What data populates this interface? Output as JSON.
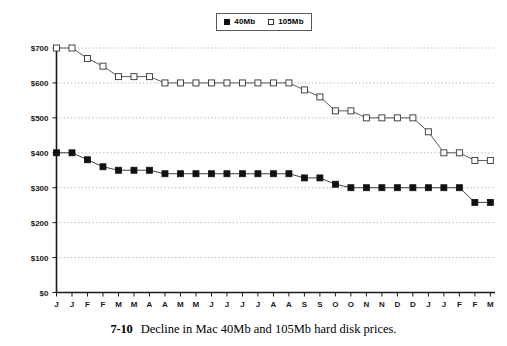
{
  "figure": {
    "caption_number": "7-10",
    "caption_text": "Decline in Mac 40Mb and 105Mb hard disk prices."
  },
  "legend": {
    "position": "top-center",
    "entries": [
      {
        "label": "40Mb",
        "marker": "filled-square",
        "color": "#111111"
      },
      {
        "label": "105Mb",
        "marker": "open-square",
        "color": "#333333"
      }
    ]
  },
  "chart_data": {
    "type": "line",
    "title": "",
    "subtitle": "",
    "xlabel": "",
    "ylabel": "",
    "ylim": [
      0,
      700
    ],
    "yticks": [
      0,
      100,
      200,
      300,
      400,
      500,
      600,
      700
    ],
    "ytick_labels": [
      "$0",
      "$100",
      "$200",
      "$300",
      "$400",
      "$500",
      "$600",
      "$700"
    ],
    "grid": true,
    "grid_style": "dotted-horizontal",
    "categories": [
      "J",
      "J",
      "F",
      "F",
      "M",
      "M",
      "A",
      "A",
      "M",
      "M",
      "J",
      "J",
      "J",
      "J",
      "A",
      "A",
      "S",
      "S",
      "O",
      "O",
      "N",
      "N",
      "D",
      "D",
      "J",
      "J",
      "F",
      "F",
      "M"
    ],
    "series": [
      {
        "name": "40Mb",
        "marker": "filled-square",
        "color": "#111111",
        "values": [
          400,
          400,
          380,
          360,
          350,
          350,
          350,
          340,
          340,
          340,
          340,
          340,
          340,
          340,
          340,
          340,
          328,
          328,
          310,
          300,
          300,
          300,
          300,
          300,
          300,
          300,
          300,
          258,
          258
        ]
      },
      {
        "name": "105Mb",
        "marker": "open-square",
        "color": "#333333",
        "values": [
          700,
          700,
          670,
          648,
          618,
          618,
          618,
          600,
          600,
          600,
          600,
          600,
          600,
          600,
          600,
          600,
          580,
          560,
          520,
          520,
          500,
          500,
          500,
          500,
          460,
          400,
          400,
          378,
          378
        ]
      }
    ]
  }
}
